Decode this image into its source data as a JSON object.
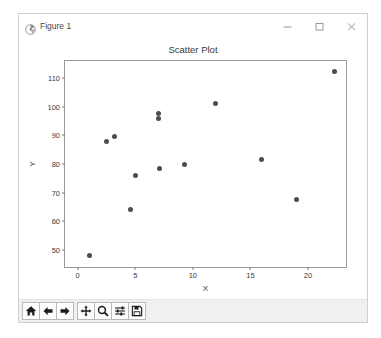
{
  "window": {
    "title": "Figure 1",
    "app_icon": "matplotlib-icon",
    "controls": [
      {
        "name": "minimize-button",
        "glyph": "minimize-icon"
      },
      {
        "name": "maximize-button",
        "glyph": "maximize-icon"
      },
      {
        "name": "close-button",
        "glyph": "close-icon"
      }
    ]
  },
  "toolbar": {
    "buttons": [
      {
        "name": "home-button",
        "icon": "home-icon",
        "tooltip": "Reset original view"
      },
      {
        "name": "back-button",
        "icon": "arrow-left-icon",
        "tooltip": "Back to previous view"
      },
      {
        "name": "forward-button",
        "icon": "arrow-right-icon",
        "tooltip": "Forward to next view"
      },
      {
        "name": "pan-button",
        "icon": "pan-move-icon",
        "tooltip": "Pan axes with left mouse, zoom with right"
      },
      {
        "name": "zoom-button",
        "icon": "magnifier-icon",
        "tooltip": "Zoom to rectangle"
      },
      {
        "name": "configure-subplots-button",
        "icon": "sliders-icon",
        "tooltip": "Configure subplots"
      },
      {
        "name": "save-button",
        "icon": "floppy-disk-icon",
        "tooltip": "Save the figure"
      }
    ]
  },
  "chart_data": {
    "type": "scatter",
    "title": "Scatter Plot",
    "xlabel": "X",
    "ylabel": "Y",
    "xlim": [
      -1.1,
      23.3
    ],
    "ylim": [
      44.0,
      116.0
    ],
    "xticks": [
      0,
      5,
      10,
      15,
      20
    ],
    "yticks": [
      50,
      60,
      70,
      80,
      90,
      100,
      110
    ],
    "grid": false,
    "legend": null,
    "marker_color": "#4d4d4d",
    "points": [
      {
        "x": 1.0,
        "y": 48.0
      },
      {
        "x": 2.5,
        "y": 88.0
      },
      {
        "x": 3.2,
        "y": 89.5
      },
      {
        "x": 4.6,
        "y": 64.0
      },
      {
        "x": 5.0,
        "y": 76.0
      },
      {
        "x": 7.0,
        "y": 97.5
      },
      {
        "x": 7.0,
        "y": 96.0
      },
      {
        "x": 7.1,
        "y": 78.5
      },
      {
        "x": 9.3,
        "y": 80.0
      },
      {
        "x": 12.0,
        "y": 101.0
      },
      {
        "x": 16.0,
        "y": 81.5
      },
      {
        "x": 19.0,
        "y": 67.5
      },
      {
        "x": 22.3,
        "y": 112.5
      }
    ]
  }
}
